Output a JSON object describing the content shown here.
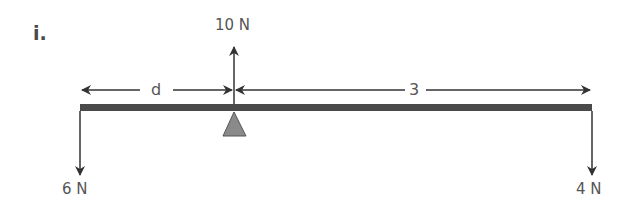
{
  "diagram": {
    "part_label": "i.",
    "beam": {
      "color": "#4a4a4a",
      "left_x": 80,
      "right_x": 592,
      "top_y": 104,
      "bottom_y": 111
    },
    "pivot": {
      "shape": "triangle",
      "color": "#8a8a8a",
      "x": 234
    },
    "forces": [
      {
        "label": "6 N",
        "direction": "down",
        "position": "left-end"
      },
      {
        "label": "10 N",
        "direction": "up",
        "position": "pivot"
      },
      {
        "label": "4 N",
        "direction": "down",
        "position": "right-end"
      }
    ],
    "dimensions": [
      {
        "label": "d",
        "from": "left-end",
        "to": "pivot"
      },
      {
        "label": "3",
        "from": "pivot",
        "to": "right-end"
      }
    ]
  }
}
